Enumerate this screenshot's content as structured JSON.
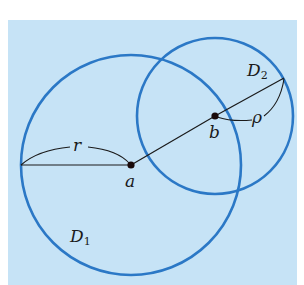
{
  "diagram": {
    "background_color": "#c6e3f6",
    "circle_color": "#2b78c6",
    "line_color": "#1a1a1a",
    "circles": [
      {
        "name": "D1",
        "center_label": "a",
        "cx": 131,
        "cy": 165,
        "r": 110
      },
      {
        "name": "D2",
        "center_label": "b",
        "cx": 215,
        "cy": 116,
        "r": 78
      }
    ],
    "points": [
      {
        "label": "a",
        "x": 131,
        "y": 165
      },
      {
        "label": "b",
        "x": 215,
        "y": 116
      }
    ],
    "segments": [
      {
        "from": [
          21,
          165
        ],
        "to": [
          131,
          165
        ],
        "label": "r"
      },
      {
        "from": [
          131,
          165
        ],
        "to": [
          215,
          116
        ]
      },
      {
        "from": [
          215,
          116
        ],
        "to": [
          284,
          78
        ],
        "label": "ρ"
      }
    ]
  },
  "labels": {
    "point_a": "a",
    "point_b": "b",
    "radius_r": "r",
    "radius_rho": "ρ",
    "disk1_main": "D",
    "disk1_sub": "1",
    "disk2_main": "D",
    "disk2_sub": "2"
  }
}
